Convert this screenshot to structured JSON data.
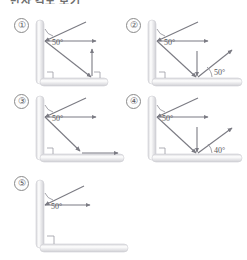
{
  "heading": {
    "text": "반사 각도 보기"
  },
  "figure": {
    "caption": "",
    "type": "physics-ray-diagram-multiple-choice",
    "common": {
      "wall_orientation": "vertical-left",
      "floor_orientation": "horizontal-bottom",
      "incident_angle_label": "50°",
      "degree_symbol": "°",
      "right_angle_marker": true
    },
    "panels": [
      {
        "id": "1",
        "label": "①",
        "angles": [
          "50°"
        ],
        "rays": [
          {
            "name": "incident-ray-to-wall",
            "from": "upper-right",
            "to": "wall-point",
            "arrow": true
          },
          {
            "name": "horizontal-reflected-ray",
            "from": "wall-point",
            "to": "right",
            "arrow": true
          },
          {
            "name": "downward-ray-to-floor",
            "from": "wall-point",
            "to": "floor-point",
            "arrow": true
          },
          {
            "name": "vertical-up-arrow",
            "from": "floor-point",
            "to": "up",
            "arrow": true
          }
        ]
      },
      {
        "id": "2",
        "label": "②",
        "angles": [
          "50°",
          "50°"
        ],
        "rays": [
          {
            "name": "incident-ray-to-wall",
            "from": "upper-right",
            "to": "wall-point",
            "arrow": true
          },
          {
            "name": "horizontal-reflected-ray",
            "from": "wall-point",
            "to": "right",
            "arrow": true
          },
          {
            "name": "downward-ray-to-floor",
            "from": "wall-point",
            "to": "floor-point",
            "arrow": true
          },
          {
            "name": "vertical-down-arrow",
            "from": "above",
            "to": "floor-point",
            "arrow": true
          },
          {
            "name": "reflected-ray-up-right",
            "from": "floor-point",
            "to": "upper-right",
            "arrow": true
          }
        ]
      },
      {
        "id": "3",
        "label": "③",
        "angles": [
          "50°"
        ],
        "rays": [
          {
            "name": "incident-ray-to-wall",
            "from": "upper-right",
            "to": "wall-point",
            "arrow": true
          },
          {
            "name": "horizontal-reflected-ray",
            "from": "wall-point",
            "to": "right",
            "arrow": true
          },
          {
            "name": "downward-ray-to-floor",
            "from": "wall-point",
            "to": "floor-point",
            "arrow": true
          },
          {
            "name": "horizontal-floor-ray",
            "from": "floor-point",
            "to": "right",
            "arrow": true
          }
        ]
      },
      {
        "id": "4",
        "label": "④",
        "angles": [
          "50°",
          "40°"
        ],
        "rays": [
          {
            "name": "incident-ray-to-wall",
            "from": "upper-right",
            "to": "wall-point",
            "arrow": true
          },
          {
            "name": "horizontal-reflected-ray",
            "from": "wall-point",
            "to": "right",
            "arrow": true
          },
          {
            "name": "downward-ray-to-floor",
            "from": "wall-point",
            "to": "floor-point",
            "arrow": true
          },
          {
            "name": "vertical-down-arrow",
            "from": "above",
            "to": "floor-point",
            "arrow": true
          },
          {
            "name": "reflected-ray-up-right",
            "from": "floor-point",
            "to": "upper-right",
            "arrow": true
          }
        ]
      },
      {
        "id": "5",
        "label": "⑤",
        "angles": [
          "50°"
        ],
        "rays": [
          {
            "name": "incident-ray-to-wall",
            "from": "upper-right",
            "to": "wall-point",
            "arrow": true
          },
          {
            "name": "horizontal-reflected-ray",
            "from": "wall-point",
            "to": "right",
            "arrow": true
          }
        ]
      }
    ]
  },
  "colors": {
    "ray": "#7b7b83",
    "wall_light": "#fdfdfd",
    "wall_dark": "#d2d2d6",
    "label_text": "#55555a",
    "background": "#ffffff"
  }
}
